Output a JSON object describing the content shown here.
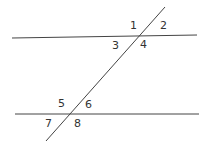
{
  "diagram": {
    "lines": {
      "top": {
        "x1": 12,
        "y1": 38,
        "x2": 197,
        "y2": 35
      },
      "bottom": {
        "x1": 15,
        "y1": 114,
        "x2": 199,
        "y2": 114
      },
      "transversal": {
        "x1": 165,
        "y1": 7,
        "x2": 46,
        "y2": 141
      }
    },
    "angle_labels": [
      {
        "text": "1",
        "x": 130,
        "y": 29
      },
      {
        "text": "2",
        "x": 160,
        "y": 29
      },
      {
        "text": "3",
        "x": 114,
        "y": 49
      },
      {
        "text": "4",
        "x": 140,
        "y": 48
      },
      {
        "text": "5",
        "x": 58,
        "y": 107
      },
      {
        "text": "6",
        "x": 85,
        "y": 108
      },
      {
        "text": "7",
        "x": 45,
        "y": 127
      },
      {
        "text": "8",
        "x": 74,
        "y": 127
      }
    ]
  }
}
